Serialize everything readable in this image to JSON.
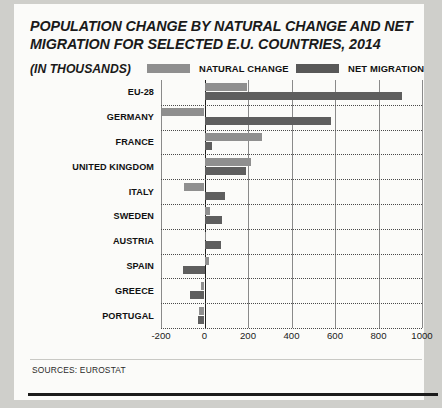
{
  "header": {
    "title": "POPULATION CHANGE BY NATURAL CHANGE AND NET MIGRATION FOR SELECTED E.U. COUNTRIES, 2014",
    "units": "(IN THOUSANDS)",
    "legend": [
      {
        "label": "NATURAL CHANGE",
        "color": "#8f8f8f"
      },
      {
        "label": "NET MIGRATION",
        "color": "#5e5e5e"
      }
    ]
  },
  "footer": {
    "sources": "SOURCES: EUROSTAT"
  },
  "chart_data": {
    "type": "bar",
    "orientation": "horizontal",
    "title": "POPULATION CHANGE BY NATURAL CHANGE AND NET MIGRATION FOR SELECTED E.U. COUNTRIES, 2014",
    "subtitle": "(IN THOUSANDS)",
    "xlabel": "",
    "ylabel": "",
    "xlim": [
      -200,
      1000
    ],
    "xticks": [
      -200,
      0,
      200,
      400,
      600,
      800,
      1000
    ],
    "xtick_labels": [
      "-200",
      "0",
      "200",
      "400",
      "600",
      "800",
      "1000"
    ],
    "grid": true,
    "legend_position": "top",
    "categories": [
      "EU-28",
      "GERMANY",
      "FRANCE",
      "UNITED KINGDOM",
      "ITALY",
      "SWEDEN",
      "AUSTRIA",
      "SPAIN",
      "GREECE",
      "PORTUGAL"
    ],
    "series": [
      {
        "name": "NATURAL CHANGE",
        "color": "#8f8f8f",
        "values": [
          195,
          -195,
          265,
          215,
          -95,
          27,
          5,
          22,
          -16,
          -23
        ]
      },
      {
        "name": "NET MIGRATION",
        "color": "#5e5e5e",
        "values": [
          910,
          580,
          33,
          190,
          95,
          80,
          75,
          -100,
          -65,
          -30
        ]
      }
    ]
  }
}
